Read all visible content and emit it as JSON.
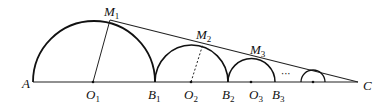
{
  "diagram": {
    "type": "geometry",
    "points": {
      "A": {
        "label": "A",
        "x": 33,
        "y": 82
      },
      "O1": {
        "label": "O",
        "sub": "1",
        "x": 93,
        "y": 82
      },
      "B1": {
        "label": "B",
        "sub": "1",
        "x": 155,
        "y": 82
      },
      "O2": {
        "label": "O",
        "sub": "2",
        "x": 191,
        "y": 82
      },
      "B2": {
        "label": "B",
        "sub": "2",
        "x": 228,
        "y": 82
      },
      "O3": {
        "label": "O",
        "sub": "3",
        "x": 251,
        "y": 82
      },
      "B3": {
        "label": "B",
        "sub": "3",
        "x": 275,
        "y": 82
      },
      "C": {
        "label": "C",
        "x": 358,
        "y": 82
      },
      "M1": {
        "label": "M",
        "sub": "1",
        "x": 110,
        "y": 20
      },
      "M2": {
        "label": "M",
        "sub": "2",
        "x": 203,
        "y": 44
      },
      "M3": {
        "label": "M",
        "sub": "3",
        "x": 258,
        "y": 58
      }
    },
    "ellipsis": "···",
    "labels": {
      "A": "A",
      "O": "O",
      "B": "B",
      "M": "M",
      "C": "C",
      "s1": "1",
      "s2": "2",
      "s3": "3"
    }
  }
}
